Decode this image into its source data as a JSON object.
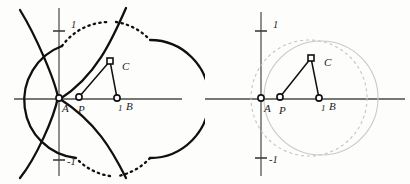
{
  "figure": {
    "panels": [
      {
        "id": "left",
        "name": "hyperbola-construction",
        "axes": {
          "x_axis_label": "",
          "y_axis_label": "",
          "y_ticks": [
            {
              "value": "1",
              "label": "1"
            },
            {
              "value": "-1",
              "label": "-1"
            }
          ],
          "x_ticks": []
        },
        "points": [
          {
            "id": "A",
            "label": "A",
            "marker": "open-circle",
            "x": 0.0,
            "y": 0.0
          },
          {
            "id": "P",
            "label": "P",
            "marker": "open-circle",
            "x": 0.23,
            "y": 0.0
          },
          {
            "id": "B",
            "label": "B",
            "marker": "open-circle",
            "x": 1.0,
            "y": 0.0
          },
          {
            "id": "C",
            "label": "C",
            "marker": "open-square",
            "x": 0.74,
            "y": 0.63
          }
        ],
        "x_axis_unit_label": "1",
        "curves": [
          {
            "name": "hyperbola-left-branch",
            "style": "solid"
          },
          {
            "name": "hyperbola-right-branch",
            "style": "solid"
          },
          {
            "name": "circle-through-C",
            "style": "partially-dotted"
          }
        ],
        "segments": [
          {
            "from": "P",
            "to": "C"
          },
          {
            "from": "B",
            "to": "C"
          }
        ]
      },
      {
        "id": "right",
        "name": "circle-construction",
        "axes": {
          "x_axis_label": "",
          "y_axis_label": "",
          "y_ticks": [
            {
              "value": "1",
              "label": "1"
            },
            {
              "value": "-1",
              "label": "-1"
            }
          ],
          "x_ticks": []
        },
        "points": [
          {
            "id": "A",
            "label": "A",
            "marker": "open-circle",
            "x": 0.0,
            "y": 0.0
          },
          {
            "id": "P",
            "label": "P",
            "marker": "open-circle",
            "x": 0.23,
            "y": 0.0
          },
          {
            "id": "B",
            "label": "B",
            "marker": "open-circle",
            "x": 1.0,
            "y": 0.0
          },
          {
            "id": "C",
            "label": "C",
            "marker": "open-square",
            "x": 0.66,
            "y": 0.62
          }
        ],
        "x_axis_unit_label": "1",
        "curves": [
          {
            "name": "faint-circle-large",
            "style": "faint-solid"
          },
          {
            "name": "faint-circle-dashed",
            "style": "faint-dashed"
          }
        ],
        "segments": [
          {
            "from": "P",
            "to": "C"
          },
          {
            "from": "B",
            "to": "C"
          }
        ]
      }
    ]
  },
  "colors": {
    "curve": "#101010",
    "axis": "#4a4a4a",
    "faint_curve": "#c9c9c9",
    "background": "#fdfdfc"
  }
}
